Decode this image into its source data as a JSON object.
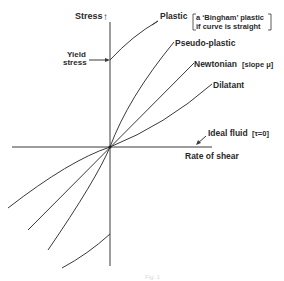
{
  "diagram": {
    "axes": {
      "y_label": "Stress",
      "y_arrow": "↑",
      "x_label": "Rate of shear"
    },
    "yield": {
      "line1": "Yield",
      "line2": "stress"
    },
    "curves": [
      {
        "name": "Plastic",
        "note_line1": "a ‘Bingham’ plastic",
        "note_line2": "if curve is straight"
      },
      {
        "name": "Pseudo-plastic"
      },
      {
        "name": "Newtonian",
        "note": "[slope μ]"
      },
      {
        "name": "Dilatant"
      },
      {
        "name": "Ideal fluid",
        "note": "[τ=0]"
      }
    ],
    "caption": "Fig. 1"
  }
}
